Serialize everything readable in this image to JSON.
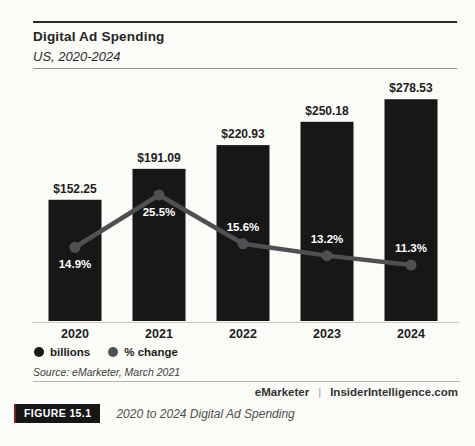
{
  "header": {
    "title": "Digital Ad Spending",
    "subtitle": "US, 2020-2024"
  },
  "chart_data": {
    "type": "bar",
    "subtype": "bar-line-combo",
    "title": "Digital Ad Spending",
    "subtitle": "US, 2020-2024",
    "categories": [
      "2020",
      "2021",
      "2022",
      "2023",
      "2024"
    ],
    "series": [
      {
        "name": "billions",
        "type": "bar",
        "unit": "USD billions",
        "values": [
          152.25,
          191.09,
          220.93,
          250.18,
          278.53
        ],
        "labels": [
          "$152.25",
          "$191.09",
          "$220.93",
          "$250.18",
          "$278.53"
        ],
        "color": "#171717"
      },
      {
        "name": "% change",
        "type": "line",
        "unit": "percent",
        "values": [
          14.9,
          25.5,
          15.6,
          13.2,
          11.3
        ],
        "labels": [
          "14.9%",
          "25.5%",
          "15.6%",
          "13.2%",
          "11.3%"
        ],
        "color": "#4f5053"
      }
    ],
    "bar_axis_range": [
      0,
      285
    ],
    "line_axis_range": [
      0,
      30
    ],
    "grid": false,
    "value_labels_visible": true,
    "legend_position": "bottom-left"
  },
  "legend": {
    "items": [
      {
        "label": "billions",
        "color": "#171717",
        "marker": "circle"
      },
      {
        "label": "% change",
        "color": "#4f5053",
        "marker": "circle"
      }
    ]
  },
  "source": "Source: eMarketer, March 2021",
  "footer": {
    "brand_left": "eMarketer",
    "separator": "|",
    "brand_right": "InsiderIntelligence.com"
  },
  "figure": {
    "badge": "FIGURE 15.1",
    "caption": "2020 to 2024 Digital Ad Spending",
    "accent_color": "#7d1d1d"
  }
}
